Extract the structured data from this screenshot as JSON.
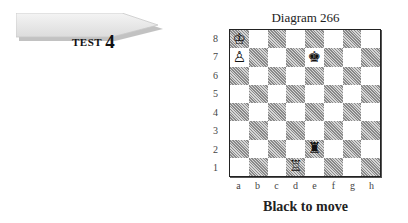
{
  "test_tag": {
    "label": "TEST",
    "number": "4"
  },
  "diagram": {
    "title": "Diagram 266",
    "caption": "Black to move",
    "ranks": [
      "8",
      "7",
      "6",
      "5",
      "4",
      "3",
      "2",
      "1"
    ],
    "files": [
      "a",
      "b",
      "c",
      "d",
      "e",
      "f",
      "g",
      "h"
    ],
    "pieces": [
      {
        "square": "a8",
        "piece": "white-king",
        "glyph": "♔"
      },
      {
        "square": "a7",
        "piece": "white-pawn",
        "glyph": "♙"
      },
      {
        "square": "e7",
        "piece": "black-king",
        "glyph": "♚"
      },
      {
        "square": "e2",
        "piece": "black-rook",
        "glyph": "♜"
      },
      {
        "square": "d1",
        "piece": "white-rook",
        "glyph": "♖"
      }
    ]
  }
}
